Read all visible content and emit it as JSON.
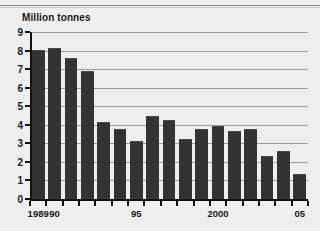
{
  "chart_data": {
    "type": "bar",
    "title": "Million tonnes",
    "ylabel": "Million tonnes",
    "xlabel": "",
    "ylim": [
      0,
      9
    ],
    "y_ticks": [
      0,
      1,
      2,
      3,
      4,
      5,
      6,
      7,
      8,
      9
    ],
    "grid": true,
    "legend": "none",
    "bar_color": "#333333",
    "background_color": "#eeeeee",
    "categories": [
      "1989",
      "1990",
      "1991",
      "1992",
      "1993",
      "1994",
      "1995",
      "1996",
      "1997",
      "1998",
      "1999",
      "2000",
      "2001",
      "2002",
      "2003",
      "2004",
      "2005"
    ],
    "x_tick_labels": [
      {
        "category": "1989",
        "label": "1989"
      },
      {
        "category": "1990",
        "label": "90"
      },
      {
        "category": "1995",
        "label": "95"
      },
      {
        "category": "2000",
        "label": "2000"
      },
      {
        "category": "2005",
        "label": "05"
      }
    ],
    "values": [
      8.05,
      8.15,
      7.6,
      6.9,
      4.15,
      3.8,
      3.15,
      4.45,
      4.25,
      3.25,
      3.75,
      3.95,
      3.65,
      3.8,
      2.3,
      2.6,
      1.35
    ]
  }
}
